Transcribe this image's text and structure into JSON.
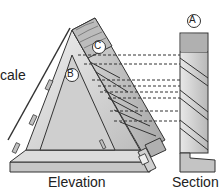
{
  "labels": {
    "scale": "cale",
    "elevation": "Elevation",
    "section": "Section"
  },
  "markers": {
    "a": "A",
    "b": "B",
    "c": "C"
  },
  "colors": {
    "outline": "#333333",
    "panel_light": "#e6e6e6",
    "panel_mid": "#c8c8c8",
    "panel_dark": "#9a9a9a",
    "wood": "#bdbdbd",
    "dash": "#333333"
  }
}
